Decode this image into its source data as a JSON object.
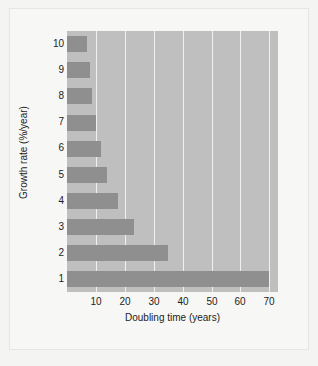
{
  "chart_data": {
    "type": "bar",
    "orientation": "horizontal",
    "title": "",
    "xlabel": "Doubling time (years)",
    "ylabel": "Growth rate (%/year)",
    "categories": [
      "10",
      "9",
      "8",
      "7",
      "6",
      "5",
      "4",
      "3",
      "2",
      "1"
    ],
    "values": [
      7.0,
      7.8,
      8.8,
      10.0,
      11.7,
      14.0,
      17.5,
      23.3,
      35.0,
      70.0
    ],
    "xticks": [
      10,
      20,
      30,
      40,
      50,
      60,
      70
    ],
    "xlim": [
      0,
      73
    ],
    "grid": "vertical",
    "legend": "none",
    "colors": {
      "bar": "#8f8f8f",
      "plot_background": "#bfbfbf",
      "gridline": "#f0f0ee",
      "figure_background": "#f4f4f2",
      "text": "#1c1c1c"
    }
  }
}
